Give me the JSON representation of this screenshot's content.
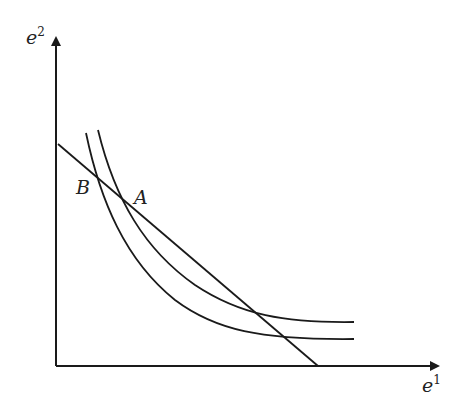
{
  "diagram": {
    "axes": {
      "y_label": "e",
      "y_label_sup": "2",
      "x_label": "e",
      "x_label_sup": "1"
    },
    "points": [
      {
        "label": "B"
      },
      {
        "label": "A"
      }
    ],
    "colors": {
      "stroke": "#1a1a1a",
      "background": "#ffffff"
    }
  }
}
